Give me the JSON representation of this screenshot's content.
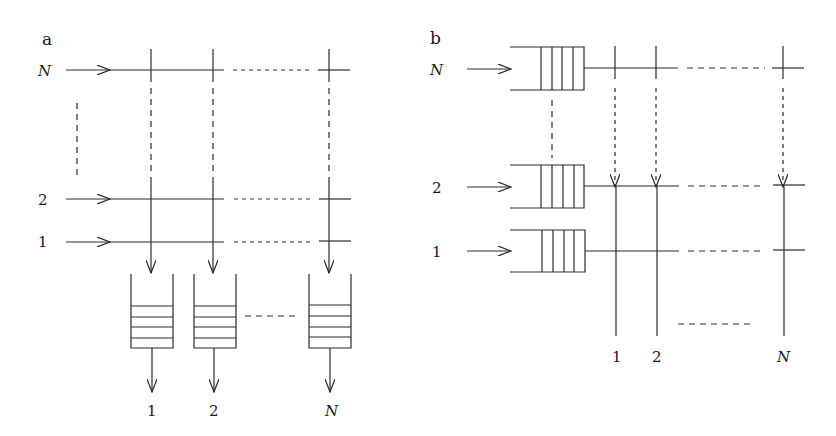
{
  "panel_a": {
    "label": "a",
    "input_rows": [
      {
        "label": "N",
        "italic": true
      },
      {
        "label": "2",
        "italic": false
      },
      {
        "label": "1",
        "italic": false
      }
    ],
    "output_queues": [
      {
        "label": "1",
        "italic": false
      },
      {
        "label": "2",
        "italic": false
      },
      {
        "label": "N",
        "italic": true
      }
    ],
    "description": "Output-queued switch: N inputs, crossbar, N output FIFO queues"
  },
  "panel_b": {
    "label": "b",
    "input_queues": [
      {
        "label": "N",
        "italic": true
      },
      {
        "label": "2",
        "italic": false
      },
      {
        "label": "1",
        "italic": false
      }
    ],
    "outputs": [
      {
        "label": "1",
        "italic": false
      },
      {
        "label": "2",
        "italic": false
      },
      {
        "label": "N",
        "italic": true
      }
    ],
    "description": "Input-queued switch: N input FIFO queues feeding crossbar, N outputs"
  },
  "colors": {
    "stroke": "#2a2a2a",
    "background": "#ffffff"
  }
}
